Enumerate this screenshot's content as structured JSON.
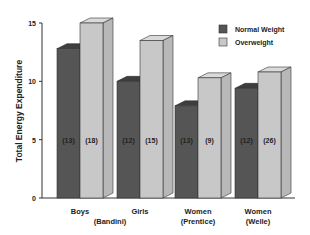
{
  "chart_data": {
    "type": "bar",
    "title": "",
    "xlabel": "",
    "ylabel": "Total Energy Expenditure",
    "ylim": [
      0,
      15
    ],
    "yticks": [
      0,
      5,
      10,
      15
    ],
    "grid": false,
    "legend_position": "top-right",
    "categories": [
      "Boys",
      "Girls\n(Bandini)",
      "Women\n(Prentice)",
      "Women\n(Welle)"
    ],
    "category_lines": [
      [
        "Boys",
        ""
      ],
      [
        "Girls",
        ""
      ],
      [
        "Women",
        "(Prentice)"
      ],
      [
        "Women",
        "(Welle)"
      ]
    ],
    "group_caption": {
      "text": "(Bandini)",
      "spans": [
        0,
        1
      ]
    },
    "series": [
      {
        "name": "Normal Weight",
        "color": "#555555",
        "values": [
          12.8,
          10.0,
          7.9,
          9.4
        ],
        "n": [
          "(13)",
          "(12)",
          "(13)",
          "(12)"
        ]
      },
      {
        "name": "Overweight",
        "color": "#c8c8c8",
        "values": [
          15.0,
          13.5,
          10.3,
          10.8
        ],
        "n": [
          "(18)",
          "(15)",
          "(9)",
          "(26)"
        ]
      }
    ]
  },
  "legend": {
    "items": [
      {
        "label": "Normal Weight",
        "color": "#555555"
      },
      {
        "label": "Overweight",
        "color": "#c8c8c8"
      }
    ]
  }
}
